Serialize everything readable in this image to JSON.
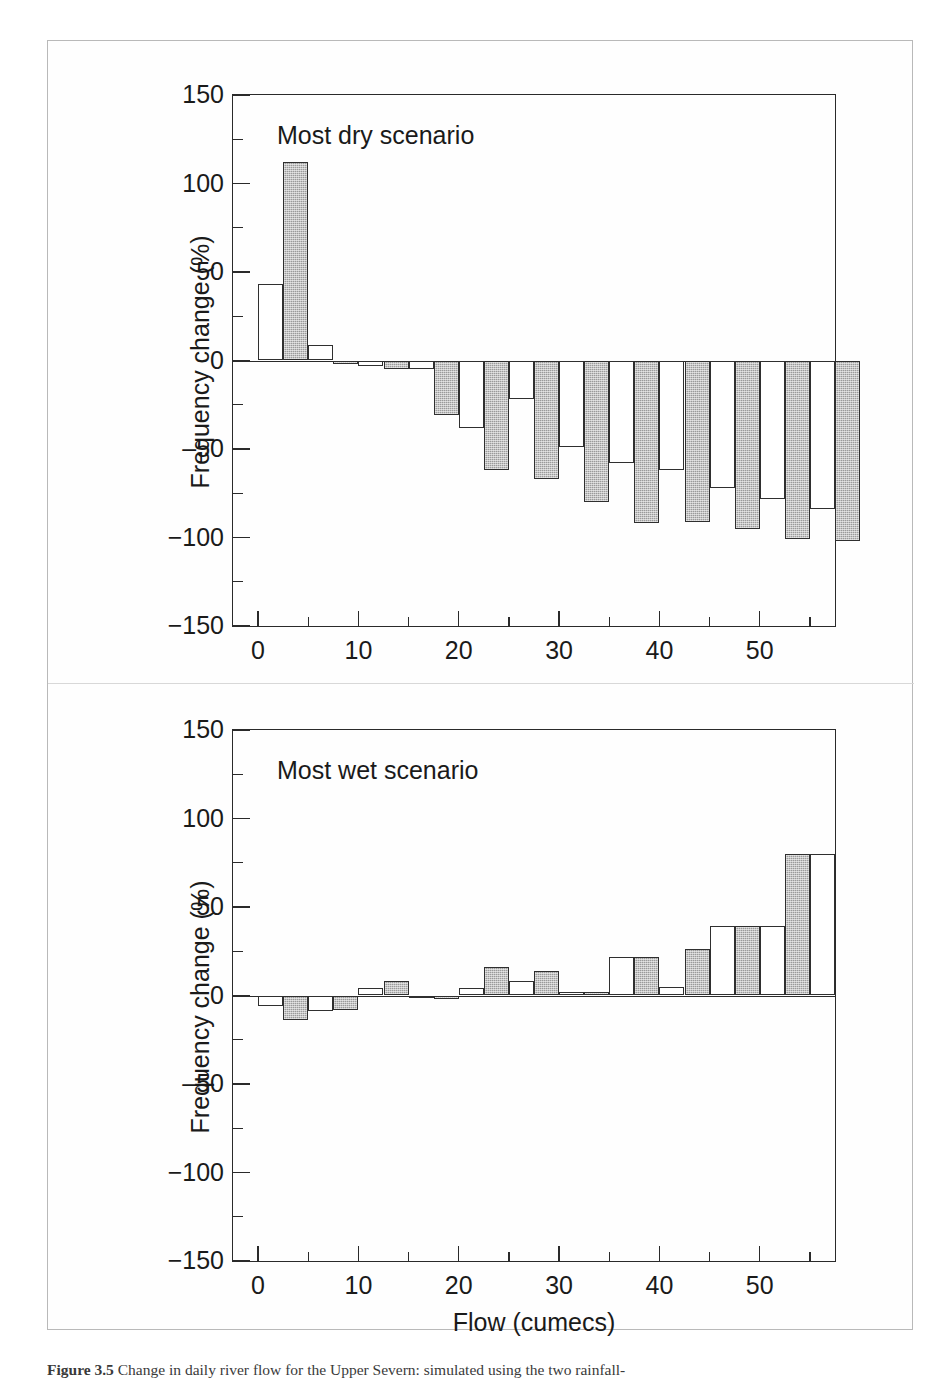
{
  "figure": {
    "caption_number": "Figure 3.5",
    "caption_text": "Change in daily river flow for the Upper Severn: simulated using the two rainfall-",
    "x_axis_title": "Flow (cumecs)",
    "y_axis_title": "Frequency change (%)"
  },
  "panels": [
    {
      "id": "dry",
      "scenario_label": "Most dry scenario"
    },
    {
      "id": "wet",
      "scenario_label": "Most wet scenario"
    }
  ],
  "chart_data": [
    {
      "type": "bar",
      "title": "Most dry scenario",
      "xlabel": "Flow (cumecs)",
      "ylabel": "Frequency change (%)",
      "xlim": [
        -2.5,
        57.5
      ],
      "ylim": [
        -150,
        150
      ],
      "yticks": [
        150,
        100,
        50,
        0,
        -50,
        -100,
        -150
      ],
      "ytick_labels": [
        "150",
        "100",
        "50",
        "0",
        "‒50",
        "−100",
        "−150"
      ],
      "yticks_minor": [
        125,
        75,
        25,
        -25,
        -75,
        -125
      ],
      "xticks": [
        0,
        10,
        20,
        30,
        40,
        50
      ],
      "xtick_labels": [
        "0",
        "10",
        "20",
        "30",
        "40",
        "50"
      ],
      "xticks_minor": [
        5,
        15,
        25,
        35,
        45,
        55
      ],
      "grid": false,
      "legend": "none",
      "bin_width": 5,
      "bin_starts": [
        0,
        5,
        10,
        15,
        20,
        25,
        30,
        35,
        40,
        45,
        50,
        55
      ],
      "series": [
        {
          "name": "white-bar",
          "fill": "white",
          "values": [
            43,
            9,
            -3,
            -5,
            -38,
            -22,
            -49,
            -58,
            -62,
            -72,
            -78,
            -84
          ]
        },
        {
          "name": "gray-bar",
          "fill": "gray",
          "values": [
            112,
            -2,
            -5,
            -31,
            -62,
            -67,
            -80,
            -92,
            -91,
            -95,
            -101,
            -102
          ]
        }
      ]
    },
    {
      "type": "bar",
      "title": "Most wet scenario",
      "xlabel": "Flow (cumecs)",
      "ylabel": "Frequency change (%)",
      "xlim": [
        -2.5,
        57.5
      ],
      "ylim": [
        -150,
        150
      ],
      "yticks": [
        150,
        100,
        50,
        0,
        -50,
        -100,
        -150
      ],
      "ytick_labels": [
        "150",
        "100",
        "50",
        "0",
        "‒50",
        "−100",
        "−150"
      ],
      "yticks_minor": [
        125,
        75,
        25,
        -25,
        -75,
        -125
      ],
      "xticks": [
        0,
        10,
        20,
        30,
        40,
        50
      ],
      "xtick_labels": [
        "0",
        "10",
        "20",
        "30",
        "40",
        "50"
      ],
      "xticks_minor": [
        5,
        15,
        25,
        35,
        45,
        55
      ],
      "grid": false,
      "legend": "none",
      "bin_width": 5,
      "bin_starts": [
        0,
        5,
        10,
        15,
        20,
        25,
        30,
        35,
        40,
        45,
        50,
        55
      ],
      "series": [
        {
          "name": "white-bar",
          "fill": "white",
          "values": [
            -6,
            -9,
            4,
            -1,
            4,
            8,
            2,
            22,
            5,
            39,
            39,
            80
          ]
        },
        {
          "name": "gray-bar",
          "fill": "gray",
          "values": [
            -14,
            -8,
            8,
            -2,
            16,
            14,
            2,
            22,
            26,
            39,
            80,
            0
          ]
        }
      ]
    }
  ]
}
